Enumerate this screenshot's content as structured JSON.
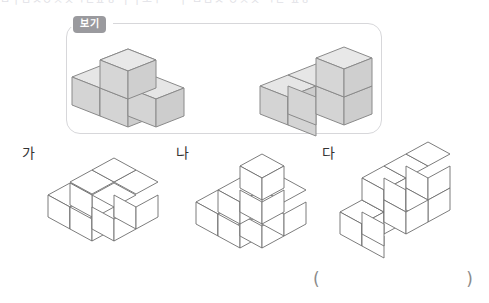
{
  "page": {
    "width": 489,
    "height": 303,
    "background": "#ffffff",
    "cutoff_text": "ㅁㅣㅂㅅㅇㅈㅊㅋㅌㅍㅎ ㅏㅓㅗㅜ ㅡㅣ ㅁㅂㅅ ㅇㅈㅊ ㅋㅌ ㅍㅎ"
  },
  "example": {
    "badge_label": "보기",
    "badge_color": "#9a9a9e",
    "panel_border_color": "#d7d7da",
    "figures": [
      {
        "name": "example-figure-1",
        "cube_fill": "#d8d8d8",
        "cube_top_fill": "#e4e4e4",
        "cube_side_fill": "#cfcfcf",
        "cube_count": 4,
        "layout": "three cubes in a row with one cube on top of the middle cube"
      },
      {
        "name": "example-figure-2",
        "cube_fill": "#d8d8d8",
        "cube_top_fill": "#e4e4e4",
        "cube_side_fill": "#cfcfcf",
        "cube_count": 4,
        "layout": "three cubes in a row with one cube on top of the right cube"
      }
    ]
  },
  "options": [
    {
      "label": "가",
      "name": "option-ga",
      "cube_count": 5,
      "layout": "flat single layer plus/cross shape of five cubes"
    },
    {
      "label": "나",
      "name": "option-na",
      "cube_count": 6,
      "layout": "three level staircase pyramid of cubes"
    },
    {
      "label": "다",
      "name": "option-da",
      "cube_count": 7,
      "layout": "two layer stepped block, upper row of three over lower row"
    }
  ],
  "answer": {
    "open_paren": "(",
    "close_paren": ")",
    "value": ""
  },
  "style": {
    "outline_color": "#6e6e6e",
    "thin_outline_color": "#8a8a8a"
  }
}
